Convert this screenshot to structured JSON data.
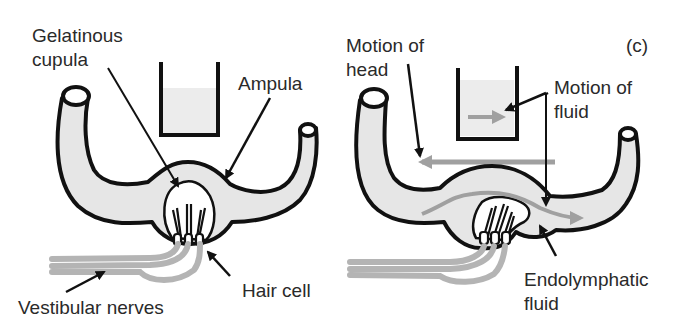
{
  "panel_label": "(c)",
  "left": {
    "labels": {
      "cupula_line1": "Gelatinous",
      "cupula_line2": "cupula",
      "ampula": "Ampula",
      "hair_cell": "Hair cell",
      "vestibular": "Vestibular nerves"
    }
  },
  "right": {
    "labels": {
      "head_line1": "Motion of",
      "head_line2": "head",
      "fluid_line1": "Motion of",
      "fluid_line2": "fluid",
      "endo_line1": "Endolymphatic",
      "endo_line2": "fluid"
    }
  },
  "colors": {
    "canal_fill": "#e6e6e6",
    "outline": "#111111",
    "arrow_gray": "#a0a0a0",
    "nerve_gray": "#b4b4b4",
    "text": "#2a2a2a"
  }
}
